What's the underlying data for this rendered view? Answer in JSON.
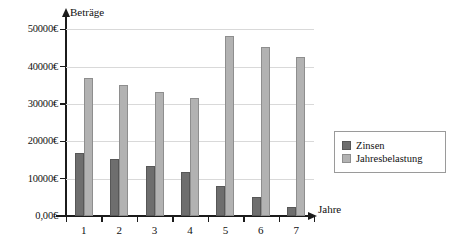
{
  "chart_data": {
    "type": "bar",
    "title": "",
    "xlabel": "Jahre",
    "ylabel": "Beträge",
    "categories": [
      "1",
      "2",
      "3",
      "4",
      "5",
      "6",
      "7"
    ],
    "series": [
      {
        "name": "Zinsen",
        "color": "#6e6e6e",
        "values": [
          16800,
          15200,
          13400,
          11800,
          8000,
          5200,
          2400
        ]
      },
      {
        "name": "Jahresbelastung",
        "color": "#b2b2b2",
        "values": [
          37000,
          35000,
          33200,
          31700,
          48200,
          45300,
          42600
        ]
      }
    ],
    "ylim": [
      0,
      52000
    ],
    "ytick_values": [
      0,
      10000,
      20000,
      30000,
      40000,
      50000
    ],
    "ytick_labels": [
      "0,00€",
      "10000€",
      "20000€",
      "30000€",
      "40000€",
      "50000€"
    ],
    "grid": true,
    "legend_position": "right"
  },
  "legend": {
    "entries": [
      {
        "label": "Zinsen"
      },
      {
        "label": "Jahresbelastung"
      }
    ]
  }
}
